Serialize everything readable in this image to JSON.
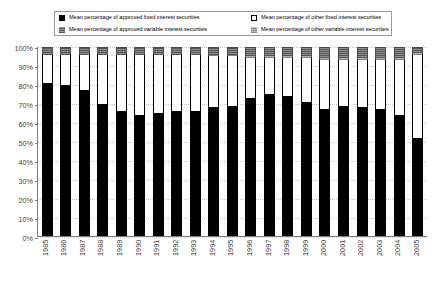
{
  "legend": {
    "items": [
      {
        "label": "Mean percentage of approved fixed interest securities",
        "swatch": "black-square-icon",
        "color": "#000000"
      },
      {
        "label": "Mean percentage of other fixed interest securities",
        "swatch": "white-square-icon",
        "color": "#ffffff"
      },
      {
        "label": "Mean percentage of approved variable interest securities",
        "swatch": "dark-gray-square-icon",
        "color": "#7f7f7f"
      },
      {
        "label": "Mean percentage of other variable interest securities",
        "swatch": "light-gray-square-icon",
        "color": "#a6a6a6"
      }
    ]
  },
  "chart_data": {
    "type": "bar",
    "stacked": true,
    "title": "",
    "xlabel": "",
    "ylabel": "",
    "ylim": [
      0,
      100
    ],
    "grid": true,
    "legend_position": "top",
    "categories": [
      "1985",
      "1986",
      "1987",
      "1988",
      "1989",
      "1990",
      "1991",
      "1992",
      "1993",
      "1994",
      "1995",
      "1996",
      "1997",
      "1998",
      "1999",
      "2000",
      "2001",
      "2002",
      "2003",
      "2004",
      "2005"
    ],
    "ytick_labels": [
      "100%",
      "90%",
      "80%",
      "70%",
      "60%",
      "50%",
      "40%",
      "30%",
      "20%",
      "10%",
      "0%"
    ],
    "ytick_values": [
      100,
      90,
      80,
      70,
      60,
      50,
      40,
      30,
      20,
      10,
      0
    ],
    "series": [
      {
        "name": "Mean percentage of approved fixed interest securities",
        "color": "#000000",
        "values": [
          81,
          80,
          77,
          70,
          66,
          64,
          65,
          66,
          66,
          68,
          69,
          73,
          75,
          74,
          71,
          67,
          69,
          68,
          67,
          64,
          52
        ]
      },
      {
        "name": "Mean percentage of other fixed interest securities",
        "color": "#ffffff",
        "values": [
          15,
          16,
          19,
          26,
          30,
          32,
          31,
          30,
          30,
          27,
          26,
          21,
          19,
          20,
          23,
          26,
          24,
          25,
          26,
          29,
          44
        ]
      },
      {
        "name": "Mean percentage of approved variable interest securities",
        "color": "#7f7f7f",
        "values": [
          0,
          0,
          0,
          0,
          0,
          0,
          0,
          0,
          0,
          1,
          1,
          1,
          1,
          1,
          1,
          1,
          1,
          1,
          1,
          1,
          1
        ]
      },
      {
        "name": "Mean percentage of other variable interest securities",
        "color": "#a6a6a6",
        "values": [
          4,
          4,
          4,
          4,
          4,
          4,
          4,
          4,
          4,
          4,
          4,
          5,
          5,
          5,
          5,
          6,
          6,
          6,
          6,
          6,
          3
        ]
      }
    ]
  }
}
